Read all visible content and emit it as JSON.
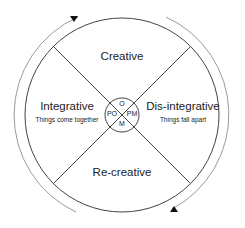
{
  "diagram": {
    "type": "cycle-wheel",
    "quadrants": {
      "top": {
        "title": "Creative"
      },
      "left": {
        "title": "Integrative",
        "subtitle": "Things come together"
      },
      "right": {
        "title": "Dis-integrative",
        "subtitle": "Things fall apart"
      },
      "bottom": {
        "title": "Re-creative"
      }
    },
    "center": {
      "top": "O",
      "left": "PO",
      "right": "PM",
      "bottom": "M"
    },
    "arrows": {
      "direction": "clockwise",
      "top_left_arrow": "down-arrow",
      "bottom_right_arrow": "up-arrow"
    },
    "colors": {
      "line": "#333333",
      "outer_arc": "#999999",
      "text": "#222222"
    }
  }
}
